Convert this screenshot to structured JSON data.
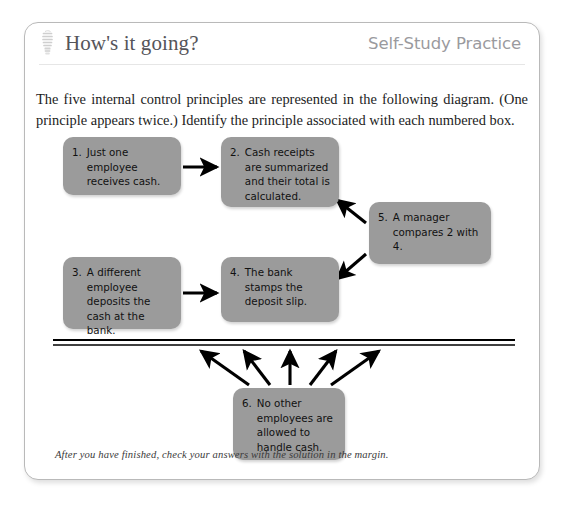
{
  "header": {
    "icon": "lightbulb-icon",
    "title": "How's it going?",
    "eyebrow": "Self-Study Practice"
  },
  "intro": {
    "text": "The five internal control principles are represented in the following diagram. (One principle appears twice.) Identify the principle associated with each numbered box."
  },
  "diagram": {
    "box_fill": "#9b9b9b",
    "arrow_color": "#000000",
    "nodes": [
      {
        "id": "node1",
        "number": "1.",
        "text": "Just one employee receives cash."
      },
      {
        "id": "node2",
        "number": "2.",
        "text": "Cash receipts are summarized and their total is calculated."
      },
      {
        "id": "node5",
        "number": "5.",
        "text": "A manager compares 2 with 4."
      },
      {
        "id": "node3",
        "number": "3.",
        "text": "A different employee deposits the cash at the bank."
      },
      {
        "id": "node4",
        "number": "4.",
        "text": "The bank stamps the deposit slip."
      },
      {
        "id": "node6",
        "number": "6.",
        "text": "No other employees are allowed to handle cash."
      }
    ],
    "connectors": [
      {
        "from": "node1",
        "to": "node2",
        "kind": "arrow-right"
      },
      {
        "from": "node3",
        "to": "node4",
        "kind": "arrow-right"
      },
      {
        "from": "node5",
        "to": "node2",
        "kind": "arrow-up-left"
      },
      {
        "from": "node5",
        "to": "node4",
        "kind": "arrow-down-left"
      },
      {
        "from": "node6",
        "to": "separator-line",
        "kind": "arrow-fan-up",
        "count": 5
      }
    ],
    "separator": {
      "name": "double-rule",
      "style": "double-horizontal-line"
    }
  },
  "footer": {
    "note": "After you have finished, check your answers with the solution in the margin."
  }
}
